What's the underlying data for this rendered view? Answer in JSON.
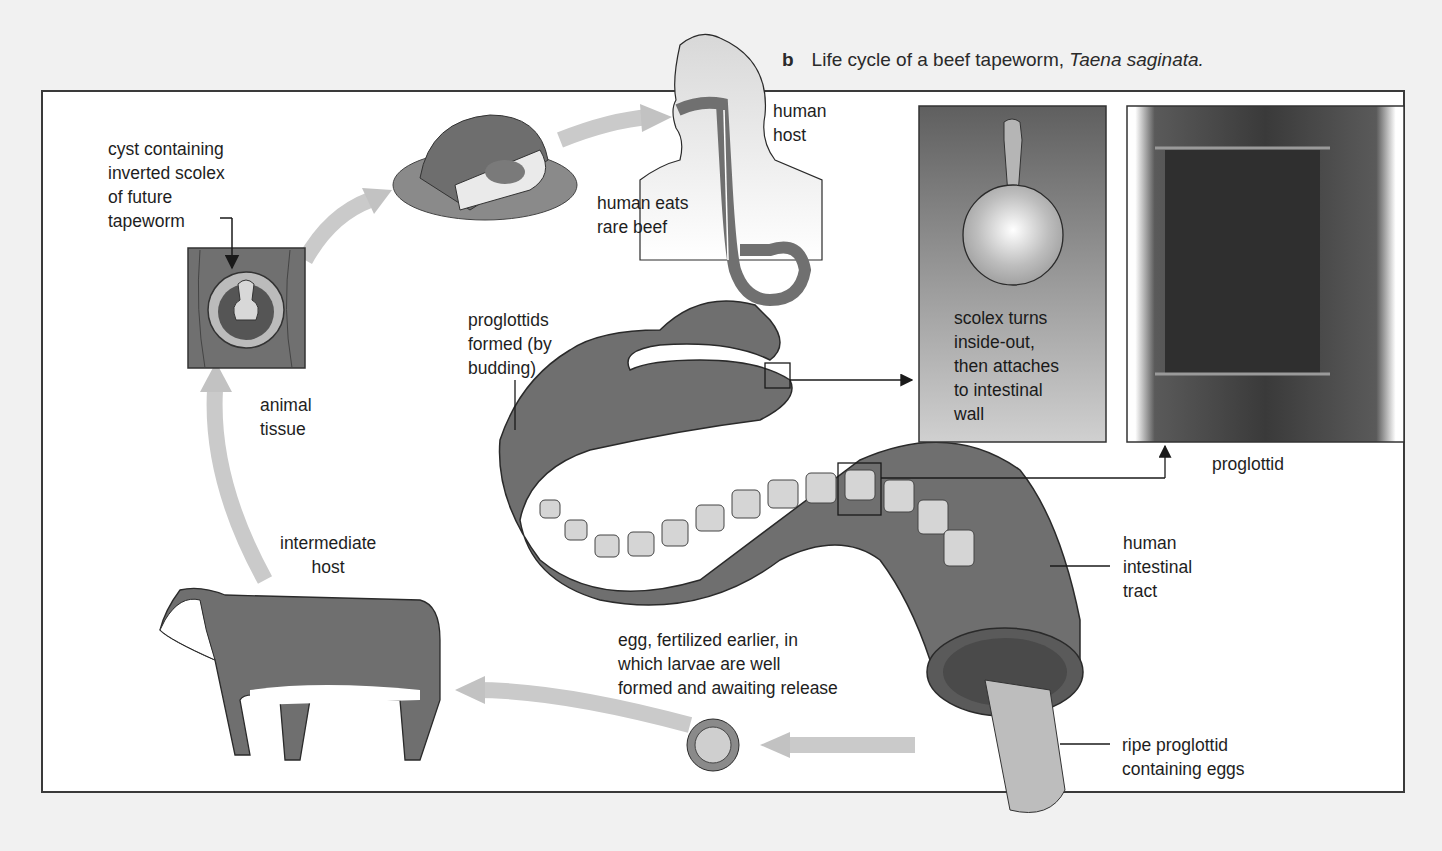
{
  "caption": {
    "letter": "b",
    "text": "Life cycle of a beef tapeworm,",
    "species": "Taena saginata."
  },
  "labels": {
    "cyst": "cyst containing\ninverted scolex\nof future\ntapeworm",
    "animal_tissue": "animal\ntissue",
    "intermediate_host": "intermediate\nhost",
    "human_host": "human\nhost",
    "human_eats": "human eats\nrare beef",
    "proglottids_formed": "proglottids\nformed (by\nbudding)",
    "scolex_turns": "scolex turns\ninside-out,\nthen attaches\nto intestinal\nwall",
    "proglottid": "proglottid",
    "human_intestinal_tract": "human\nintestinal\ntract",
    "egg": "egg, fertilized earlier, in\nwhich larvae are well\nformed and awaiting release",
    "ripe_proglottid": "ripe proglottid\ncontaining eggs"
  },
  "colors": {
    "background": "#f1f1f1",
    "frame_fill": "#ffffff",
    "frame_border": "#3a3a3a",
    "intestine": "#6e6e6e",
    "segment": "#cfcfcf",
    "cycle_arrow": "#c8c8c8",
    "panel_dark": "#6a6a6a",
    "panel_light": "#c9c9c9"
  },
  "icons": {
    "beef": "beef-steak-illustration",
    "cow": "cow-illustration",
    "human": "human-silhouette-illustration",
    "cyst": "cyst-in-tissue-illustration",
    "egg": "tapeworm-egg-illustration",
    "scolex": "scolex-illustration",
    "proglottid_photo": "proglottid-photo",
    "intestine": "intestine-with-tapeworm-illustration"
  }
}
